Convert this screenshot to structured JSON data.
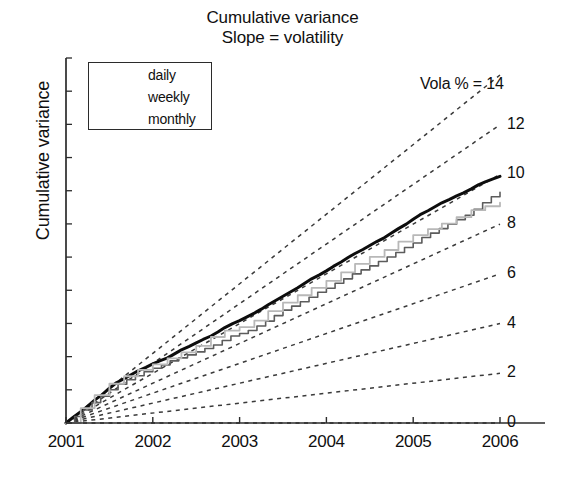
{
  "chart_data": {
    "type": "line",
    "title": "Cumulative variance",
    "subtitle": "Slope = volatility",
    "xlabel": "",
    "ylabel": "Cumulative variance",
    "grid": false,
    "legend_position": "upper-left",
    "xlim": [
      2001,
      2006
    ],
    "ylim": [
      0,
      14
    ],
    "x_tick_labels": [
      "2001",
      "2002",
      "2003",
      "2004",
      "2005",
      "2006"
    ],
    "x_tick_values": [
      2001,
      2002,
      2003,
      2004,
      2005,
      2006
    ],
    "y_tick_labels": [],
    "y_axis_note": "tick marks only, unlabelled",
    "right_axis_label": "Vola % = 14",
    "right_axis_values": [
      14,
      12,
      10,
      8,
      6,
      4,
      2,
      0
    ],
    "right_axis_tick_labels": [
      "14",
      "12",
      "10",
      "8",
      "6",
      "4",
      "2",
      "0"
    ],
    "reference_lines": {
      "description": "dashed straight lines from origin; slope equals annualised volatility in percent",
      "style": "dashed",
      "slopes_percent": [
        14,
        12,
        10,
        8,
        6,
        4,
        2,
        0
      ]
    },
    "series": [
      {
        "name": "daily",
        "color": "#0d0d0d",
        "width": 3.0,
        "style": "solid",
        "x": [
          2001.0,
          2001.08,
          2001.17,
          2001.25,
          2001.33,
          2001.42,
          2001.5,
          2001.58,
          2001.67,
          2001.75,
          2001.83,
          2001.92,
          2002.0,
          2002.08,
          2002.17,
          2002.25,
          2002.33,
          2002.42,
          2002.5,
          2002.58,
          2002.67,
          2002.75,
          2002.83,
          2002.92,
          2003.0,
          2003.08,
          2003.17,
          2003.25,
          2003.33,
          2003.42,
          2003.5,
          2003.58,
          2003.67,
          2003.75,
          2003.83,
          2003.92,
          2004.0,
          2004.08,
          2004.17,
          2004.25,
          2004.33,
          2004.42,
          2004.5,
          2004.58,
          2004.67,
          2004.75,
          2004.83,
          2004.92,
          2005.0,
          2005.08,
          2005.17,
          2005.25,
          2005.33,
          2005.42,
          2005.5,
          2005.58,
          2005.67,
          2005.75,
          2005.83,
          2005.92,
          2006.0
        ],
        "y": [
          0.0,
          0.22,
          0.45,
          0.68,
          0.92,
          1.15,
          1.4,
          1.62,
          1.78,
          1.94,
          2.1,
          2.24,
          2.38,
          2.5,
          2.62,
          2.78,
          2.94,
          3.08,
          3.22,
          3.36,
          3.5,
          3.66,
          3.84,
          4.0,
          4.12,
          4.26,
          4.42,
          4.58,
          4.76,
          4.94,
          5.1,
          5.26,
          5.44,
          5.62,
          5.8,
          5.96,
          6.12,
          6.3,
          6.48,
          6.66,
          6.82,
          6.98,
          7.14,
          7.3,
          7.46,
          7.64,
          7.82,
          8.0,
          8.2,
          8.38,
          8.54,
          8.7,
          8.86,
          9.0,
          9.14,
          9.26,
          9.42,
          9.58,
          9.7,
          9.82,
          9.92
        ]
      },
      {
        "name": "weekly",
        "color": "#5c5c5c",
        "width": 1.6,
        "style": "solid-stepped",
        "x": [
          2001.0,
          2001.1,
          2001.2,
          2001.3,
          2001.4,
          2001.5,
          2001.6,
          2001.7,
          2001.8,
          2001.9,
          2002.0,
          2002.1,
          2002.2,
          2002.3,
          2002.4,
          2002.5,
          2002.6,
          2002.7,
          2002.8,
          2002.9,
          2003.0,
          2003.1,
          2003.2,
          2003.3,
          2003.4,
          2003.5,
          2003.6,
          2003.7,
          2003.8,
          2003.9,
          2004.0,
          2004.1,
          2004.2,
          2004.3,
          2004.4,
          2004.5,
          2004.6,
          2004.7,
          2004.8,
          2004.9,
          2005.0,
          2005.1,
          2005.2,
          2005.3,
          2005.4,
          2005.5,
          2005.6,
          2005.7,
          2005.8,
          2005.9,
          2006.0
        ],
        "y": [
          0.0,
          0.26,
          0.52,
          0.82,
          1.08,
          1.34,
          1.56,
          1.74,
          1.9,
          2.06,
          2.2,
          2.34,
          2.5,
          2.62,
          2.74,
          2.86,
          3.0,
          3.14,
          3.32,
          3.5,
          3.6,
          3.72,
          3.9,
          4.1,
          4.32,
          4.54,
          4.7,
          4.88,
          5.06,
          5.26,
          5.42,
          5.62,
          5.8,
          6.0,
          6.16,
          6.32,
          6.5,
          6.68,
          6.86,
          7.06,
          7.24,
          7.46,
          7.64,
          7.82,
          8.0,
          8.18,
          8.36,
          8.6,
          8.86,
          9.1,
          9.28
        ]
      },
      {
        "name": "monthly",
        "color": "#b8b8b8",
        "width": 1.8,
        "style": "solid-stepped",
        "x": [
          2001.0,
          2001.17,
          2001.33,
          2001.5,
          2001.67,
          2001.83,
          2002.0,
          2002.17,
          2002.33,
          2002.5,
          2002.67,
          2002.83,
          2003.0,
          2003.17,
          2003.33,
          2003.5,
          2003.67,
          2003.83,
          2004.0,
          2004.17,
          2004.33,
          2004.5,
          2004.67,
          2004.83,
          2005.0,
          2005.17,
          2005.33,
          2005.5,
          2005.67,
          2005.83,
          2006.0
        ],
        "y": [
          0.0,
          0.6,
          1.12,
          1.58,
          1.88,
          2.14,
          2.36,
          2.6,
          2.84,
          3.1,
          3.46,
          3.72,
          3.86,
          4.12,
          4.5,
          4.84,
          5.14,
          5.44,
          5.72,
          6.06,
          6.4,
          6.68,
          6.96,
          7.3,
          7.56,
          7.8,
          8.02,
          8.28,
          8.56,
          8.72,
          8.86
        ]
      }
    ]
  },
  "legend": {
    "items": [
      {
        "label": "daily"
      },
      {
        "label": "weekly"
      },
      {
        "label": "monthly"
      }
    ]
  },
  "axes": {
    "x_labels": [
      "2001",
      "2002",
      "2003",
      "2004",
      "2005",
      "2006"
    ],
    "right_labels": [
      "Vola % = 14",
      "12",
      "10",
      "8",
      "6",
      "4",
      "2",
      "0"
    ]
  },
  "colors": {
    "daily": "#0d0d0d",
    "weekly": "#5c5c5c",
    "monthly": "#b8b8b8",
    "reference_line": "#3a3a3a",
    "axis": "#2b2b2b",
    "background": "#ffffff"
  }
}
